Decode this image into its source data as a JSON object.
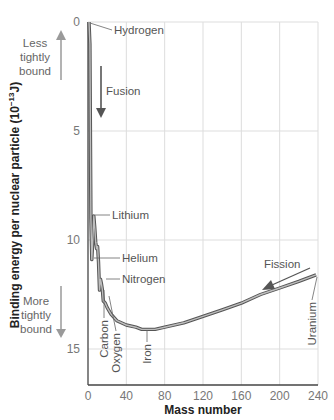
{
  "chart_data": {
    "type": "line",
    "title": "",
    "xlabel": "Mass number",
    "ylabel": "Binding energy per nuclear particle (10^-13 J)",
    "ylabel_parts": {
      "main": "Binding energy per nuclear particle (10",
      "exp": "−13",
      "unit": "J)"
    },
    "xlim": [
      0,
      240
    ],
    "ylim": [
      0,
      16.7
    ],
    "y_inverted": true,
    "x_ticks": [
      0,
      40,
      80,
      120,
      160,
      200,
      240
    ],
    "y_ticks": [
      0,
      5,
      10,
      15
    ],
    "grid": true,
    "series": [
      {
        "name": "Binding energy curve",
        "x": [
          1,
          2,
          3,
          4,
          5,
          6,
          7,
          8,
          9,
          10,
          11,
          12,
          13,
          14,
          15,
          16,
          18,
          20,
          24,
          30,
          40,
          50,
          56,
          62,
          70,
          80,
          100,
          120,
          140,
          160,
          180,
          200,
          220,
          238
        ],
        "y": [
          0,
          1.0,
          9.0,
          10.9,
          10.0,
          8.9,
          9.4,
          10.1,
          10.4,
          10.3,
          11.0,
          12.3,
          11.8,
          12.0,
          12.3,
          12.8,
          12.9,
          13.1,
          13.4,
          13.7,
          13.9,
          14.0,
          14.1,
          14.1,
          14.1,
          14.0,
          13.8,
          13.5,
          13.2,
          12.9,
          12.5,
          12.2,
          11.9,
          11.6
        ]
      }
    ],
    "annotations": [
      {
        "text": "Hydrogen",
        "x": 1,
        "y": 0
      },
      {
        "text": "Lithium",
        "x": 6,
        "y": 8.9
      },
      {
        "text": "Helium",
        "x": 4,
        "y": 10.9
      },
      {
        "text": "Nitrogen",
        "x": 14,
        "y": 12.0
      },
      {
        "text": "Carbon",
        "x": 12,
        "y": 12.3
      },
      {
        "text": "Oxygen",
        "x": 16,
        "y": 12.8
      },
      {
        "text": "Iron",
        "x": 56,
        "y": 14.1
      },
      {
        "text": "Uranium",
        "x": 238,
        "y": 11.6
      },
      {
        "text": "Fusion",
        "arrow": "down"
      },
      {
        "text": "Fission",
        "arrow": "left-down"
      }
    ],
    "side_labels": {
      "top": [
        "Less",
        "tightly",
        "bound"
      ],
      "bottom": [
        "More",
        "tightly",
        "bound"
      ]
    },
    "colors": {
      "curve_outline": "#555555",
      "curve_fill": "#bdbdbd",
      "grid": "#dddddd",
      "axis": "#444444",
      "arrow": "#555555",
      "side_arrow": "#9a9a9a"
    }
  }
}
